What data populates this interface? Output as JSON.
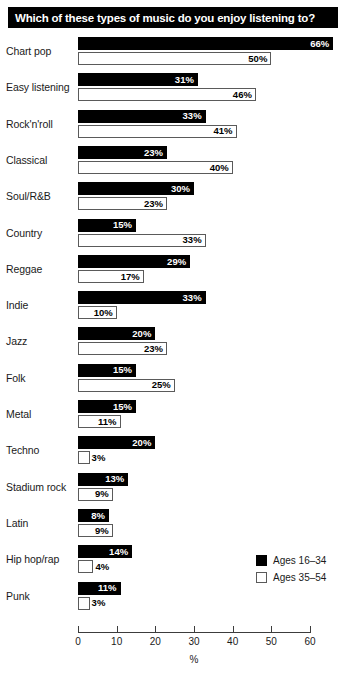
{
  "chart_data": {
    "type": "bar",
    "orientation": "horizontal",
    "title": "Which of these types of music do you enjoy listening to?",
    "xlabel": "%",
    "ylabel": "",
    "xlim": [
      0,
      60
    ],
    "xticks": [
      0,
      10,
      20,
      30,
      40,
      50,
      60
    ],
    "grid": false,
    "legend_position": "bottom-right",
    "value_suffix": "%",
    "categories": [
      "Chart pop",
      "Easy listening",
      "Rock'n'roll",
      "Classical",
      "Soul/R&B",
      "Country",
      "Reggae",
      "Indie",
      "Jazz",
      "Folk",
      "Metal",
      "Techno",
      "Stadium rock",
      "Latin",
      "Hip hop/rap",
      "Punk"
    ],
    "series": [
      {
        "name": "Ages 16–34",
        "color": "#000000",
        "values": [
          66,
          31,
          33,
          23,
          30,
          15,
          29,
          33,
          20,
          15,
          15,
          20,
          13,
          8,
          14,
          11
        ],
        "labels": [
          "66%",
          "31%",
          "33%",
          "23%",
          "30%",
          "15%",
          "29%",
          "33%",
          "20%",
          "15%",
          "15%",
          "20%",
          "13%",
          "8%",
          "14%",
          "11%"
        ]
      },
      {
        "name": "Ages 35–54",
        "color": "#ffffff",
        "values": [
          50,
          46,
          41,
          40,
          23,
          33,
          17,
          10,
          23,
          25,
          11,
          3,
          9,
          9,
          4,
          3
        ],
        "labels": [
          "50%",
          "46%",
          "41%",
          "40%",
          "23%",
          "33%",
          "17%",
          "10%",
          "23%",
          "25%",
          "11%",
          "3%",
          "9%",
          "9%",
          "4%",
          "3%"
        ]
      }
    ]
  },
  "legend": {
    "items": [
      {
        "label": "Ages 16–34"
      },
      {
        "label": "Ages 35–54"
      }
    ]
  },
  "axis": {
    "tick_labels": [
      "0",
      "10",
      "20",
      "30",
      "40",
      "50",
      "60"
    ],
    "unit_label": "%"
  }
}
